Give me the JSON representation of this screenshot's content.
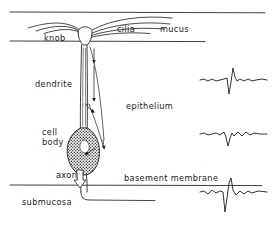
{
  "figure": {
    "ink_color": "#1b1b1b",
    "background_color": "#ffffff"
  },
  "labels": {
    "knob": "knob",
    "cilia": "cilia",
    "mucus": "mucus",
    "dendrite": "dendrite",
    "epithelium": "epithelium",
    "cell_body_line1": "cell",
    "cell_body_line2": "body",
    "axon": "axon",
    "basement_membrane": "basement membrane",
    "submucosa": "submucosa"
  },
  "layers": [
    {
      "name": "mucus",
      "label": "mucus",
      "top_y": 12,
      "bottom_y": 41
    },
    {
      "name": "epithelium",
      "label": "epithelium",
      "top_y": 41,
      "bottom_y": 185
    },
    {
      "name": "submucosa",
      "label": "submucosa",
      "top_y": 185,
      "bottom_y": 228
    }
  ],
  "cell_parts": [
    {
      "name": "knob",
      "label": "knob",
      "x": 85,
      "y": 38
    },
    {
      "name": "cilia",
      "label": "cilia",
      "count": 7
    },
    {
      "name": "dendrite",
      "label": "dendrite",
      "x": 85,
      "y": 45,
      "length": 85
    },
    {
      "name": "cell-body",
      "label": "cell body",
      "x": 83,
      "y": 145,
      "shading": "stipple"
    },
    {
      "name": "axon",
      "label": "axon",
      "x": 83,
      "y": 178
    }
  ],
  "arrows": {
    "dendrite_downward_count": 3,
    "axon_hollow_arrow": true,
    "feedback_arrow": true
  },
  "chart_data": {
    "type": "line",
    "xlabel": "",
    "ylabel": "",
    "grid": false,
    "legend": null,
    "series": [
      {
        "name": "trace-1",
        "label": "trace at dendrite level",
        "position_y": 80,
        "points": [
          [
            0,
            0
          ],
          [
            4,
            1
          ],
          [
            8,
            -1
          ],
          [
            12,
            1
          ],
          [
            16,
            -1
          ],
          [
            20,
            0
          ],
          [
            24,
            1
          ],
          [
            27,
            2
          ],
          [
            29,
            -14
          ],
          [
            31,
            -2
          ],
          [
            33,
            12
          ],
          [
            35,
            3
          ],
          [
            37,
            -1
          ],
          [
            40,
            1
          ],
          [
            44,
            -1
          ],
          [
            48,
            1
          ],
          [
            52,
            -1
          ],
          [
            56,
            0
          ],
          [
            62,
            1
          ],
          [
            67,
            0
          ]
        ]
      },
      {
        "name": "trace-2",
        "label": "trace at cell body level",
        "position_y": 134,
        "points": [
          [
            0,
            0
          ],
          [
            4,
            1
          ],
          [
            8,
            -1
          ],
          [
            12,
            0
          ],
          [
            16,
            1
          ],
          [
            20,
            -1
          ],
          [
            24,
            2
          ],
          [
            26,
            -3
          ],
          [
            28,
            -12
          ],
          [
            30,
            -4
          ],
          [
            32,
            1
          ],
          [
            34,
            -2
          ],
          [
            38,
            2
          ],
          [
            42,
            -2
          ],
          [
            46,
            2
          ],
          [
            50,
            -1
          ],
          [
            54,
            1
          ],
          [
            60,
            0
          ],
          [
            67,
            0
          ]
        ]
      },
      {
        "name": "trace-3",
        "label": "trace at axon / basement membrane level",
        "position_y": 192,
        "points": [
          [
            0,
            0
          ],
          [
            4,
            1
          ],
          [
            8,
            -2
          ],
          [
            12,
            2
          ],
          [
            16,
            -1
          ],
          [
            20,
            1
          ],
          [
            23,
            0
          ],
          [
            25,
            -20
          ],
          [
            27,
            -6
          ],
          [
            29,
            9
          ],
          [
            31,
            14
          ],
          [
            33,
            2
          ],
          [
            36,
            -3
          ],
          [
            40,
            1
          ],
          [
            44,
            -2
          ],
          [
            48,
            1
          ],
          [
            52,
            -1
          ],
          [
            58,
            1
          ],
          [
            67,
            0
          ]
        ]
      }
    ]
  }
}
